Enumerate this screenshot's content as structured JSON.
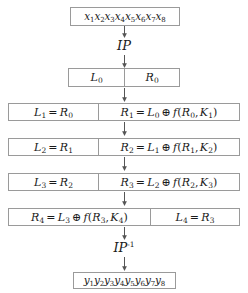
{
  "diagram": {
    "colors": {
      "border": "#9a9a9a",
      "background": "#ffffff",
      "text": "#1a1a1a",
      "arrow": "#555555"
    },
    "input_block": {
      "name": "plaintext-block",
      "symbols": [
        "x",
        "x",
        "x",
        "x",
        "x",
        "x",
        "x",
        "x"
      ],
      "indices": [
        "1",
        "2",
        "3",
        "4",
        "5",
        "6",
        "7",
        "8"
      ],
      "text": "x1x2x3x4x5x6x7x8"
    },
    "initial_permutation": {
      "name": "initial-permutation",
      "label": "IP"
    },
    "split_block": {
      "left": {
        "label": "L",
        "index": "0",
        "text": "L0"
      },
      "right": {
        "label": "R",
        "index": "0",
        "text": "R0"
      }
    },
    "rounds": [
      {
        "round": 1,
        "swapped": false,
        "left": {
          "text": "L1 = R0",
          "parts": [
            {
              "sym": "L",
              "sub": "1"
            },
            {
              "op": "="
            },
            {
              "sym": "R",
              "sub": "0"
            }
          ]
        },
        "right": {
          "text": "R1 = L0 ⊕ f(R0, K1)",
          "parts": [
            {
              "sym": "R",
              "sub": "1"
            },
            {
              "op": "="
            },
            {
              "sym": "L",
              "sub": "0"
            },
            {
              "op": "⊕"
            },
            {
              "sym": "f"
            },
            {
              "paren": "("
            },
            {
              "sym": "R",
              "sub": "0"
            },
            {
              "comma": ","
            },
            {
              "sym": "K",
              "sub": "1"
            },
            {
              "paren": ")"
            }
          ]
        }
      },
      {
        "round": 2,
        "swapped": false,
        "left": {
          "text": "L2 = R1",
          "parts": [
            {
              "sym": "L",
              "sub": "2"
            },
            {
              "op": "="
            },
            {
              "sym": "R",
              "sub": "1"
            }
          ]
        },
        "right": {
          "text": "R2 = L1 ⊕ f(R1, K2)",
          "parts": [
            {
              "sym": "R",
              "sub": "2"
            },
            {
              "op": "="
            },
            {
              "sym": "L",
              "sub": "1"
            },
            {
              "op": "⊕"
            },
            {
              "sym": "f"
            },
            {
              "paren": "("
            },
            {
              "sym": "R",
              "sub": "1"
            },
            {
              "comma": ","
            },
            {
              "sym": "K",
              "sub": "2"
            },
            {
              "paren": ")"
            }
          ]
        }
      },
      {
        "round": 3,
        "swapped": false,
        "left": {
          "text": "L3 = R2",
          "parts": [
            {
              "sym": "L",
              "sub": "3"
            },
            {
              "op": "="
            },
            {
              "sym": "R",
              "sub": "2"
            }
          ]
        },
        "right": {
          "text": "R3 = L2 ⊕ f(R2, K3)",
          "parts": [
            {
              "sym": "R",
              "sub": "3"
            },
            {
              "op": "="
            },
            {
              "sym": "L",
              "sub": "2"
            },
            {
              "op": "⊕"
            },
            {
              "sym": "f"
            },
            {
              "paren": "("
            },
            {
              "sym": "R",
              "sub": "2"
            },
            {
              "comma": ","
            },
            {
              "sym": "K",
              "sub": "3"
            },
            {
              "paren": ")"
            }
          ]
        }
      },
      {
        "round": 4,
        "swapped": true,
        "left": {
          "text": "R4 = L3 ⊕ f(R3, K4)",
          "parts": [
            {
              "sym": "R",
              "sub": "4"
            },
            {
              "op": "="
            },
            {
              "sym": "L",
              "sub": "3"
            },
            {
              "op": "⊕"
            },
            {
              "sym": "f"
            },
            {
              "paren": "("
            },
            {
              "sym": "R",
              "sub": "3"
            },
            {
              "comma": ","
            },
            {
              "sym": "K",
              "sub": "4"
            },
            {
              "paren": ")"
            }
          ]
        },
        "right": {
          "text": "L4 = R3",
          "parts": [
            {
              "sym": "L",
              "sub": "4"
            },
            {
              "op": "="
            },
            {
              "sym": "R",
              "sub": "3"
            }
          ]
        }
      }
    ],
    "final_permutation": {
      "name": "inverse-initial-permutation",
      "label": "IP",
      "exponent": "-1",
      "text": "IP-1"
    },
    "output_block": {
      "name": "ciphertext-block",
      "symbols": [
        "y",
        "y",
        "y",
        "y",
        "y",
        "y",
        "y",
        "y"
      ],
      "indices": [
        "1",
        "2",
        "3",
        "4",
        "5",
        "6",
        "7",
        "8"
      ],
      "text": "y1y2y3y4y5y6y7y8"
    },
    "arrows": [
      {
        "name": "arrow-plaintext-to-ip",
        "from": "plaintext-block",
        "to": "initial-permutation"
      },
      {
        "name": "arrow-ip-to-split",
        "from": "initial-permutation",
        "to": "split-block"
      },
      {
        "name": "arrow-split-to-round1",
        "from": "split-block",
        "to": "round-1"
      },
      {
        "name": "arrow-round1-to-round2",
        "from": "round-1",
        "to": "round-2"
      },
      {
        "name": "arrow-round2-to-round3",
        "from": "round-2",
        "to": "round-3"
      },
      {
        "name": "arrow-round3-to-round4",
        "from": "round-3",
        "to": "round-4"
      },
      {
        "name": "arrow-round4-to-ipinv",
        "from": "round-4",
        "to": "inverse-initial-permutation"
      },
      {
        "name": "arrow-ipinv-to-ciphertext",
        "from": "inverse-initial-permutation",
        "to": "ciphertext-block"
      }
    ]
  }
}
